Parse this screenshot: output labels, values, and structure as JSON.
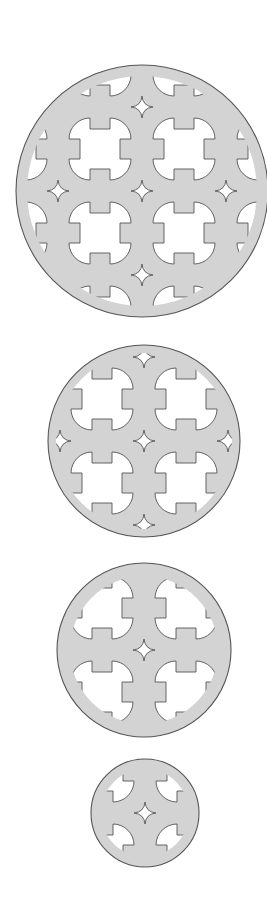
{
  "figure": {
    "width": 267,
    "height": 909,
    "colors": {
      "background": "#ffffff",
      "fill": "#d3d3d3",
      "outline": "#555555",
      "cutout": "#ffffff"
    },
    "hole_shape": {
      "half_size": 31,
      "tab_half_width": 10,
      "tab_depth": 20,
      "lobe_radius": 21
    },
    "star_shape": {
      "radius": 11,
      "waist": 3
    },
    "grid_spacing": 84,
    "disks": [
      {
        "id": "disk-large",
        "cx": 142,
        "cy": 191,
        "r": 126,
        "clip_r": 115,
        "hole_range": [
          -2,
          1
        ],
        "star_range": [
          -1,
          1
        ]
      },
      {
        "id": "disk-medium",
        "cx": 144,
        "cy": 441,
        "r": 96,
        "clip_r": 88,
        "hole_range": [
          -1,
          0
        ],
        "star_range": [
          -1,
          1
        ]
      },
      {
        "id": "disk-small",
        "cx": 144,
        "cy": 650,
        "r": 87,
        "clip_r": 74,
        "hole_range": [
          -1,
          0
        ],
        "star_range": [
          0,
          0
        ]
      },
      {
        "id": "disk-smallest",
        "cx": 145,
        "cy": 813,
        "r": 54,
        "clip_r": 44,
        "hole_range": [
          -1,
          0
        ],
        "star_range": [
          0,
          0
        ]
      }
    ]
  }
}
